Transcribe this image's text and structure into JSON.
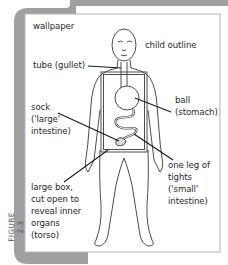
{
  "figure": {
    "number": "FIGURE 2.3",
    "frame_color": "#9a9a9a",
    "labels": {
      "wallpaper": "wallpaper",
      "child_outline": "child outline",
      "tube": "tube (gullet)",
      "ball_line1": "ball",
      "ball_line2": "(stomach)",
      "sock_line1": "sock",
      "sock_line2": "('large'",
      "sock_line3": "intestine)",
      "tights_line1": "one leg of",
      "tights_line2": "tights",
      "tights_line3": "('small'",
      "tights_line4": "intestine)",
      "box_line1": "large box,",
      "box_line2": "cut open to",
      "box_line3": "reveal inner",
      "box_line4": "organs",
      "box_line5": "(torso)"
    }
  }
}
